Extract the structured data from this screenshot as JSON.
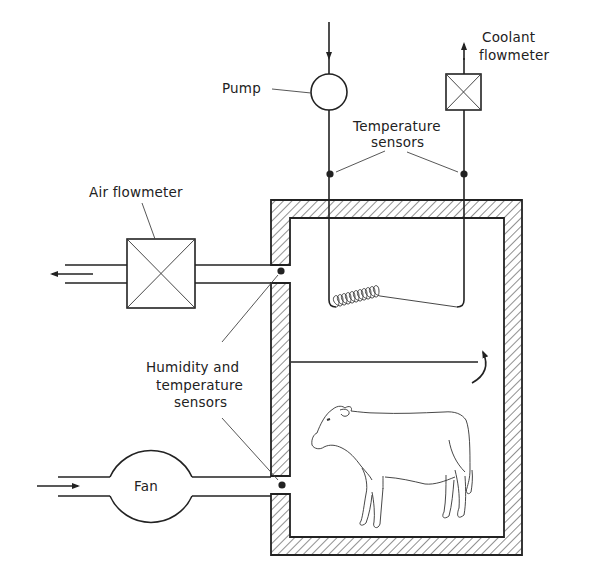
{
  "diagram": {
    "labels": {
      "pump": "Pump",
      "coolant_flowmeter_line1": "Coolant",
      "coolant_flowmeter_line2": "flowmeter",
      "temperature_sensors_line1": "Temperature",
      "temperature_sensors_line2": "sensors",
      "air_flowmeter": "Air flowmeter",
      "humidity_line1": "Humidity and",
      "humidity_line2": "temperature",
      "humidity_line3": "sensors",
      "fan": "Fan"
    },
    "components": [
      {
        "id": "pump",
        "label": "Pump",
        "shape": "circle"
      },
      {
        "id": "coolant-flowmeter",
        "label": "Coolant flowmeter",
        "shape": "crossed-box"
      },
      {
        "id": "temperature-sensors",
        "label": "Temperature sensors",
        "shape": "dot",
        "count": 2
      },
      {
        "id": "cooling-coil",
        "label": "",
        "shape": "coil",
        "loops": 11
      },
      {
        "id": "air-flowmeter",
        "label": "Air flowmeter",
        "shape": "crossed-box"
      },
      {
        "id": "humidity-temperature-sensors",
        "label": "Humidity and temperature sensors",
        "shape": "dot",
        "count": 2
      },
      {
        "id": "fan",
        "label": "Fan",
        "shape": "circle"
      },
      {
        "id": "chamber",
        "label": "",
        "shape": "insulated-box"
      },
      {
        "id": "baffle",
        "label": "",
        "shape": "line"
      },
      {
        "id": "airflow-arrow",
        "label": "",
        "shape": "curved-arrow"
      },
      {
        "id": "animal",
        "label": "",
        "shape": "cow-illustration"
      }
    ],
    "flows": [
      {
        "from": "inlet",
        "to": "pump",
        "direction": "down",
        "medium": "coolant"
      },
      {
        "from": "coolant-flowmeter",
        "to": "outlet",
        "direction": "up",
        "medium": "coolant"
      },
      {
        "from": "chamber",
        "to": "air-flowmeter",
        "direction": "left",
        "medium": "air out"
      },
      {
        "from": "inlet",
        "to": "fan",
        "direction": "right",
        "medium": "air in"
      }
    ],
    "colors": {
      "line": "#222222",
      "background": "#ffffff"
    }
  }
}
